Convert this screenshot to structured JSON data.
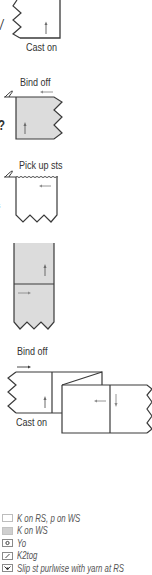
{
  "diagrams": [
    {
      "id": "cast-on-panel",
      "label": "Cast on"
    },
    {
      "id": "bind-off-panel",
      "label": "Bind off"
    },
    {
      "id": "pick-up-panel",
      "label": "Pick up sts"
    },
    {
      "id": "two-part-panel",
      "label": ""
    },
    {
      "id": "fold-panel",
      "labels": [
        "Bind off",
        "Cast on"
      ]
    }
  ],
  "edge_fragments": [
    "/",
    "?",
    "s",
    "i"
  ],
  "legend": {
    "items": [
      {
        "icon": "white-square-icon",
        "label": "K on RS, p on WS"
      },
      {
        "icon": "gray-square-icon",
        "label": "K on WS"
      },
      {
        "icon": "yarn-over-circle-icon",
        "label": "Yo"
      },
      {
        "icon": "k2tog-slash-icon",
        "label": "K2tog"
      },
      {
        "icon": "slip-stitch-icon",
        "label": "Slip st purlwise with yarn at RS"
      }
    ]
  },
  "colors": {
    "line": "#3a3a3a",
    "fill_gray": "#dcdcdc",
    "arrow": "#6a6a6a",
    "text": "#333333"
  }
}
